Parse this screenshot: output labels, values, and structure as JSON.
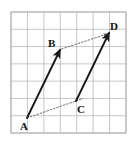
{
  "figure": {
    "background_color": "#ffffff",
    "width": 135,
    "height": 145
  },
  "grid": {
    "name": "square-grid",
    "columns": 7,
    "rows": 7,
    "x0": 11,
    "y0": 12,
    "cell_width": 16.43,
    "cell_height": 17.29,
    "line_color": "#b9b9b9",
    "border_color": "#a8a8a8"
  },
  "points": [
    {
      "id": "A",
      "label": "A",
      "x": 27,
      "y": 118,
      "label_x": 20,
      "label_y": 130
    },
    {
      "id": "B",
      "label": "B",
      "x": 60,
      "y": 50,
      "label_x": 48,
      "label_y": 47
    },
    {
      "id": "C",
      "label": "C",
      "x": 76,
      "y": 101,
      "label_x": 77,
      "label_y": 113
    },
    {
      "id": "D",
      "label": "D",
      "x": 109,
      "y": 33,
      "label_x": 110,
      "label_y": 30
    }
  ],
  "vectors": [
    {
      "id": "AB",
      "name": "vector-a-b",
      "from": "A",
      "to": "B",
      "style": "solid",
      "arrowhead": true,
      "color": "#1a1a1a",
      "width": 1.9
    },
    {
      "id": "CD",
      "name": "vector-c-d",
      "from": "C",
      "to": "D",
      "style": "solid",
      "arrowhead": true,
      "color": "#1a1a1a",
      "width": 1.9
    },
    {
      "id": "AC",
      "name": "vector-a-c",
      "from": "A",
      "to": "C",
      "style": "dotted",
      "arrowhead": false,
      "color": "#6e6e6e",
      "width": 1.0
    },
    {
      "id": "BD",
      "name": "vector-b-d",
      "from": "B",
      "to": "D",
      "style": "dotted",
      "arrowhead": true,
      "color": "#6e6e6e",
      "width": 1.0
    }
  ],
  "colors": {
    "stroke_solid": "#1a1a1a",
    "stroke_dotted": "#6e6e6e",
    "grid_line": "#b9b9b9",
    "label_text": "#111111"
  }
}
